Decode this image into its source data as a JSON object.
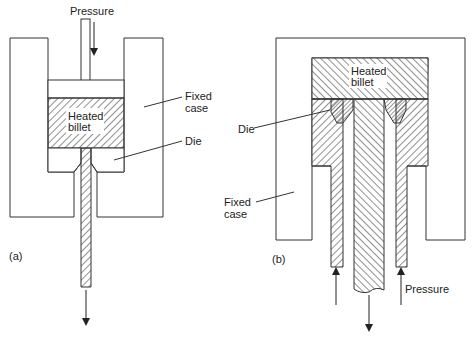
{
  "figure_a": {
    "label": "(a)",
    "pressure_label": "Pressure",
    "fixed_case_label_line1": "Fixed",
    "fixed_case_label_line2": "case",
    "billet_label_line1": "Heated",
    "billet_label_line2": "billet",
    "die_label": "Die"
  },
  "figure_b": {
    "label": "(b)",
    "pressure_label": "Pressure",
    "fixed_case_label_line1": "Fixed",
    "fixed_case_label_line2": "case",
    "billet_label_line1": "Heated",
    "billet_label_line2": "billet",
    "die_label": "Die"
  },
  "colors": {
    "line": "#333333",
    "background": "#ffffff"
  }
}
